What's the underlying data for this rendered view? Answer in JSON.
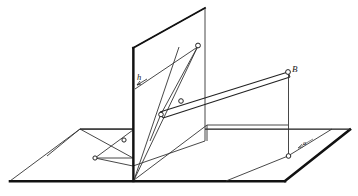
{
  "figure": {
    "background_color": "#ffffff",
    "ink_color": "#1a1a1a",
    "thin_line_color": "#333333",
    "width": 358,
    "height": 196
  },
  "labels": {
    "height_label": "h",
    "point_b_label": "B",
    "ground_mark_label": "a"
  },
  "geometry": {
    "ground_plane": {
      "name": "horizontal-ground-plane",
      "outline": "10,181 80,129 350,129 285,181",
      "thick_front_edge": "10,181 285,181",
      "thick_right_edge": "285,181 350,129"
    },
    "vertical_plane": {
      "name": "vertical-picture-plane",
      "outline": "133,48 205,8 205,141 133,166",
      "thick_left_edge": "133,48 133,166"
    },
    "ground_line": {
      "name": "ground-line-trace",
      "path": "133,166 205,141"
    },
    "back_horizontal_trace": {
      "name": "back-edge-trace",
      "path": "80,129 350,129"
    },
    "left_parallelogram": {
      "name": "left-auxiliary-parallelogram",
      "outline": "80,129 133,129 133,158 95,158"
    },
    "left_diagonals": [
      {
        "name": "left-diagonal-upper",
        "path": "80,129 133,158"
      },
      {
        "name": "left-diagonal-lower",
        "path": "95,158 133,129"
      }
    ],
    "main_lines": [
      {
        "name": "line-h-trace",
        "path": "135,88 200,45"
      },
      {
        "name": "line-base-to-apex",
        "path": "135,166 198,45"
      },
      {
        "name": "line-base-to-mid",
        "path": "135,166 177,45"
      },
      {
        "name": "line-base-to-right",
        "path": "135,166 207,125"
      },
      {
        "name": "line-lower-left-spur",
        "path": "133,166 100,148"
      }
    ],
    "beam_double_line": {
      "name": "projection-beam",
      "upper": "160,112 288,72",
      "lower": "163,117 291,77"
    },
    "beam_caps": [
      {
        "name": "beam-cap-left",
        "path": "160,112 163,117"
      },
      {
        "name": "beam-cap-right",
        "path": "288,72 291,77"
      }
    ],
    "vertical_drop_b": {
      "name": "vertical-drop-from-b",
      "path": "288,72 288,156"
    },
    "ground_ray_right": {
      "name": "ground-ray-to-right-corner",
      "path": "288,156 330,129"
    },
    "ground_ray_left": {
      "name": "ground-ray-to-front-edge",
      "path": "288,156 226,181"
    },
    "inner_right_rect": {
      "name": "inner-right-vertical-trace",
      "path": "205,125 207,125 207,141"
    },
    "inner_trace_right": {
      "name": "right-inner-trace",
      "path": "207,125 288,125"
    }
  },
  "point_markers": [
    {
      "name": "point-apex-on-plane",
      "cx": 198,
      "cy": 45,
      "r": 2.4
    },
    {
      "name": "point-beam-upper-mid",
      "cx": 180,
      "cy": 100,
      "r": 2.4
    },
    {
      "name": "point-beam-lower-left",
      "cx": 161,
      "cy": 114,
      "r": 2.4
    },
    {
      "name": "point-b",
      "cx": 288,
      "cy": 72,
      "r": 2.4
    },
    {
      "name": "point-b-foot",
      "cx": 288,
      "cy": 156,
      "r": 2.4
    },
    {
      "name": "point-left-upper",
      "cx": 124,
      "cy": 140,
      "r": 2.2
    },
    {
      "name": "point-left-lower",
      "cx": 95,
      "cy": 158,
      "r": 2.2
    }
  ],
  "annotations": {
    "h_arrow": {
      "name": "h-label-arrow",
      "path": "137,84 146,78"
    },
    "a_arrow": {
      "name": "a-label-arrow",
      "path": "299,146 312,139"
    }
  }
}
